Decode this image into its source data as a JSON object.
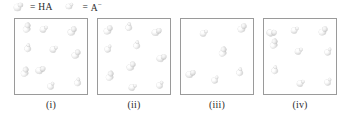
{
  "figure": {
    "type": "particle-diagram",
    "legend": {
      "entries": [
        {
          "icon": "ha-molecule-icon",
          "equals": "=",
          "label": "HA",
          "charge": ""
        },
        {
          "icon": "a-minus-ion-icon",
          "equals": "=",
          "label": "A",
          "charge": "−"
        }
      ]
    },
    "panels": [
      {
        "caption": "(i)",
        "particles": [
          {
            "species": "HA",
            "x": 6,
            "y": 8
          },
          {
            "species": "A",
            "x": 26,
            "y": 6
          },
          {
            "species": "HA",
            "x": 52,
            "y": 9
          },
          {
            "species": "A",
            "x": 8,
            "y": 28
          },
          {
            "species": "A",
            "x": 36,
            "y": 26
          },
          {
            "species": "HA",
            "x": 56,
            "y": 32
          },
          {
            "species": "HA",
            "x": 4,
            "y": 52
          },
          {
            "species": "HA",
            "x": 22,
            "y": 46
          },
          {
            "species": "A",
            "x": 32,
            "y": 64
          },
          {
            "species": "A",
            "x": 58,
            "y": 62
          }
        ]
      },
      {
        "caption": "(ii)",
        "particles": [
          {
            "species": "HA",
            "x": 5,
            "y": 8
          },
          {
            "species": "A",
            "x": 26,
            "y": 7
          },
          {
            "species": "HA",
            "x": 55,
            "y": 8
          },
          {
            "species": "A",
            "x": 6,
            "y": 27
          },
          {
            "species": "A",
            "x": 34,
            "y": 25
          },
          {
            "species": "HA",
            "x": 60,
            "y": 34
          },
          {
            "species": "HA",
            "x": 28,
            "y": 44
          },
          {
            "species": "HA",
            "x": 6,
            "y": 56
          },
          {
            "species": "A",
            "x": 32,
            "y": 64
          },
          {
            "species": "A",
            "x": 58,
            "y": 63
          }
        ]
      },
      {
        "caption": "(iii)",
        "particles": [
          {
            "species": "A",
            "x": 20,
            "y": 10
          },
          {
            "species": "HA",
            "x": 56,
            "y": 6
          },
          {
            "species": "HA",
            "x": 36,
            "y": 32
          },
          {
            "species": "HA",
            "x": 6,
            "y": 50
          },
          {
            "species": "A",
            "x": 30,
            "y": 58
          },
          {
            "species": "A",
            "x": 54,
            "y": 52
          }
        ]
      },
      {
        "caption": "(iv)",
        "particles": [
          {
            "species": "HA",
            "x": 6,
            "y": 8
          },
          {
            "species": "A",
            "x": 28,
            "y": 7
          },
          {
            "species": "HA",
            "x": 54,
            "y": 9
          },
          {
            "species": "HA",
            "x": 4,
            "y": 24
          },
          {
            "species": "A",
            "x": 32,
            "y": 28
          },
          {
            "species": "A",
            "x": 60,
            "y": 30
          },
          {
            "species": "A",
            "x": 6,
            "y": 50
          },
          {
            "species": "A",
            "x": 34,
            "y": 60
          },
          {
            "species": "A",
            "x": 60,
            "y": 60
          }
        ]
      }
    ]
  },
  "colors": {
    "box_border": "#9a9a9a",
    "text": "#2b2b2b",
    "background": "#ffffff",
    "particle_light": "#ffffff",
    "particle_shadow": "#b6b6b6"
  }
}
